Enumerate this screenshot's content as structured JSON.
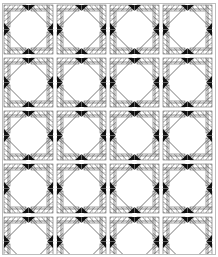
{
  "figure": {
    "description": "Black and white line-art quilt pattern: repeating blocks of on-point triangles with hatched strips and small solid black corner triangles",
    "colors": {
      "background": "#ffffff",
      "line": "#555555",
      "hatch": "#666666",
      "solid": "#111111",
      "border": "#bdbdbd"
    },
    "block_size_px": 53,
    "columns": 4,
    "rows": 5
  }
}
